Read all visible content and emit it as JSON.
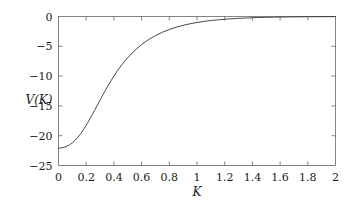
{
  "chart_data": {
    "type": "line",
    "title": "",
    "subtitle": "",
    "xlabel": "K",
    "ylabel": "V(K)",
    "xlim": [
      0,
      2
    ],
    "ylim": [
      -25,
      0
    ],
    "grid": false,
    "legend": null,
    "legend_position": "none",
    "line_color": "#333333",
    "axis_color": "#666666",
    "background_color": "#ffffff",
    "xticks": [
      {
        "value": 0,
        "label": "0"
      },
      {
        "value": 0.2,
        "label": "0.2"
      },
      {
        "value": 0.4,
        "label": "0.4"
      },
      {
        "value": 0.6,
        "label": "0.6"
      },
      {
        "value": 0.8,
        "label": "0.8"
      },
      {
        "value": 1,
        "label": "1"
      },
      {
        "value": 1.2,
        "label": "1.2"
      },
      {
        "value": 1.4,
        "label": "1.4"
      },
      {
        "value": 1.6,
        "label": "1.6"
      },
      {
        "value": 1.8,
        "label": "1.8"
      },
      {
        "value": 2,
        "label": "2"
      }
    ],
    "yticks": [
      {
        "value": 0,
        "label": "0"
      },
      {
        "value": -5,
        "label": "−5"
      },
      {
        "value": -10,
        "label": "−10"
      },
      {
        "value": -15,
        "label": "−15"
      },
      {
        "value": -20,
        "label": "−20"
      },
      {
        "value": -25,
        "label": "−25"
      }
    ],
    "series": [
      {
        "name": "V(K)",
        "x": [
          0.0,
          0.02,
          0.04,
          0.06,
          0.08,
          0.1,
          0.12,
          0.14,
          0.16,
          0.18,
          0.2,
          0.22,
          0.24,
          0.26,
          0.28,
          0.3,
          0.32,
          0.34,
          0.36,
          0.38,
          0.4,
          0.42,
          0.44,
          0.46,
          0.48,
          0.5,
          0.55,
          0.6,
          0.65,
          0.7,
          0.75,
          0.8,
          0.85,
          0.9,
          0.95,
          1.0,
          1.05,
          1.1,
          1.15,
          1.2,
          1.25,
          1.3,
          1.35,
          1.4,
          1.45,
          1.5,
          1.6,
          1.7,
          1.8,
          1.9,
          2.0
        ],
        "y": [
          -22.1,
          -22.05,
          -21.95,
          -21.78,
          -21.53,
          -21.2,
          -20.78,
          -20.27,
          -19.67,
          -18.99,
          -18.25,
          -17.45,
          -16.62,
          -15.77,
          -14.9,
          -14.03,
          -13.17,
          -12.33,
          -11.52,
          -10.74,
          -10.0,
          -9.3,
          -8.64,
          -8.02,
          -7.44,
          -6.9,
          -5.7,
          -4.7,
          -3.88,
          -3.2,
          -2.64,
          -2.18,
          -1.8,
          -1.48,
          -1.22,
          -1.0,
          -0.82,
          -0.68,
          -0.56,
          -0.46,
          -0.38,
          -0.31,
          -0.26,
          -0.21,
          -0.17,
          -0.14,
          -0.09,
          -0.06,
          -0.04,
          -0.03,
          -0.02
        ]
      }
    ]
  },
  "axes": {
    "ylabel_text": "V(K)",
    "xlabel_text": "K"
  }
}
